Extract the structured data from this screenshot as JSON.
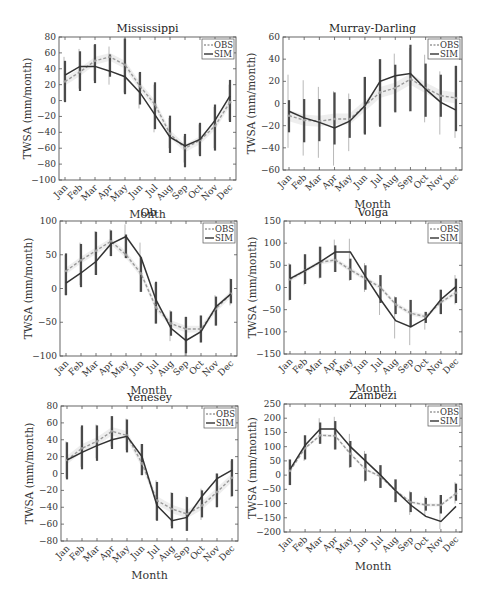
{
  "figure": {
    "months": [
      "Jan",
      "Feb",
      "Mar",
      "Apr",
      "May",
      "Jun",
      "Jul",
      "Aug",
      "Sep",
      "Oct",
      "Nov",
      "Dec"
    ],
    "xlabel": "Month",
    "ylabel": "TWSA (mm/month)",
    "legend": {
      "obs": "OBS",
      "sim": "SIM"
    },
    "colors": {
      "sim": "#333333",
      "obs": "#9a9a9a",
      "obs_band": "#e3e3e3",
      "err_sim": "#4a4a4a",
      "err_obs": "#b8b8b8",
      "axis": "#555555"
    }
  },
  "chart_data": [
    {
      "type": "line",
      "title": "Mississippi",
      "categories": [
        "Jan",
        "Feb",
        "Mar",
        "Apr",
        "May",
        "Jun",
        "Jul",
        "Aug",
        "Sep",
        "Oct",
        "Nov",
        "Dec"
      ],
      "xlabel": "Month",
      "ylabel": "TWSA (mm/month)",
      "ylim": [
        -100,
        80
      ],
      "yticks": [
        80,
        60,
        40,
        20,
        0,
        -20,
        -40,
        -60,
        -80,
        -100
      ],
      "legend_position": "upper right",
      "series": [
        {
          "name": "OBS",
          "style": "dashed",
          "values": [
            24,
            36,
            50,
            55,
            45,
            18,
            -5,
            -42,
            -60,
            -50,
            -32,
            -2
          ],
          "err_low": [
            0,
            15,
            25,
            20,
            10,
            -10,
            -40,
            -60,
            -78,
            -68,
            -60,
            -25
          ],
          "err_high": [
            55,
            65,
            70,
            68,
            78,
            35,
            20,
            -22,
            -45,
            -30,
            -8,
            20
          ]
        },
        {
          "name": "SIM",
          "style": "solid",
          "values": [
            32,
            43,
            43,
            37,
            30,
            10,
            -18,
            -46,
            -57,
            -49,
            -25,
            6
          ],
          "err_low": [
            -2,
            12,
            22,
            30,
            8,
            -5,
            -36,
            -66,
            -84,
            -70,
            -63,
            -27
          ],
          "err_high": [
            50,
            62,
            71,
            58,
            78,
            36,
            23,
            -19,
            -42,
            -28,
            -5,
            26
          ]
        }
      ]
    },
    {
      "type": "line",
      "title": "Murray-Darling",
      "categories": [
        "Jan",
        "Feb",
        "Mar",
        "Apr",
        "May",
        "Jun",
        "Jul",
        "Aug",
        "Sep",
        "Oct",
        "Nov",
        "Dec"
      ],
      "xlabel": "Month",
      "ylabel": "TWSA (mm/month)",
      "ylim": [
        -60,
        60
      ],
      "yticks": [
        60,
        40,
        20,
        0,
        -20,
        -40,
        -60
      ],
      "legend_position": "upper right",
      "series": [
        {
          "name": "OBS",
          "style": "dashed",
          "values": [
            -11,
            -15,
            -16,
            -14,
            -14,
            -2,
            10,
            14,
            22,
            14,
            7,
            5
          ],
          "err_low": [
            -40,
            -47,
            -49,
            -56,
            -43,
            -27,
            -20,
            -7,
            -7,
            -17,
            -28,
            -31
          ],
          "err_high": [
            26,
            21,
            15,
            11,
            9,
            24,
            40,
            45,
            50,
            44,
            29,
            34
          ]
        },
        {
          "name": "SIM",
          "style": "solid",
          "values": [
            -7,
            -13,
            -17,
            -22,
            -16,
            -2,
            20,
            25,
            27,
            13,
            1,
            -6
          ],
          "err_low": [
            -26,
            -35,
            -34,
            -37,
            -31,
            -28,
            -21,
            -8,
            -7,
            -12,
            -12,
            -25
          ],
          "err_high": [
            3,
            4,
            4,
            10,
            4,
            24,
            40,
            35,
            53,
            36,
            26,
            34
          ]
        }
      ]
    },
    {
      "type": "line",
      "title": "Ob",
      "categories": [
        "Jan",
        "Feb",
        "Mar",
        "Apr",
        "May",
        "Jun",
        "Jul",
        "Aug",
        "Sep",
        "Oct",
        "Nov",
        "Dec"
      ],
      "xlabel": "Month",
      "ylabel": "TWSA (mm/month)",
      "ylim": [
        -100,
        100
      ],
      "yticks": [
        100,
        50,
        0,
        -50,
        -100
      ],
      "legend_position": "upper right",
      "series": [
        {
          "name": "OBS",
          "style": "dashed",
          "values": [
            26,
            42,
            56,
            70,
            50,
            22,
            -28,
            -52,
            -60,
            -60,
            -30,
            -8
          ],
          "err_low": [
            -10,
            5,
            20,
            48,
            45,
            -5,
            -52,
            -78,
            -100,
            -80,
            -55,
            -25
          ],
          "err_high": [
            50,
            68,
            85,
            88,
            95,
            68,
            8,
            -32,
            -42,
            -40,
            -10,
            15
          ]
        },
        {
          "name": "SIM",
          "style": "solid",
          "values": [
            8,
            23,
            40,
            66,
            77,
            46,
            -17,
            -59,
            -77,
            -64,
            -27,
            -8
          ],
          "err_low": [
            -10,
            2,
            20,
            48,
            45,
            -5,
            -52,
            -70,
            -96,
            -80,
            -55,
            -22
          ],
          "err_high": [
            52,
            66,
            84,
            86,
            80,
            46,
            10,
            -34,
            -42,
            -40,
            -12,
            14
          ]
        }
      ]
    },
    {
      "type": "line",
      "title": "Volga",
      "categories": [
        "Jan",
        "Feb",
        "Mar",
        "Apr",
        "May",
        "Jun",
        "Jul",
        "Aug",
        "Sep",
        "Oct",
        "Nov",
        "Dec"
      ],
      "xlabel": "Month",
      "ylabel": "TWSA (mm/month)",
      "ylim": [
        -150,
        150
      ],
      "yticks": [
        150,
        100,
        50,
        0,
        -50,
        -100,
        -150
      ],
      "legend_position": "upper right",
      "series": [
        {
          "name": "OBS",
          "style": "dashed",
          "values": [
            18,
            38,
            57,
            62,
            40,
            20,
            0,
            -38,
            -58,
            -66,
            -33,
            -12
          ],
          "err_low": [
            -30,
            5,
            20,
            35,
            15,
            -10,
            -62,
            -115,
            -130,
            -95,
            -60,
            -38
          ],
          "err_high": [
            55,
            75,
            92,
            108,
            110,
            55,
            28,
            -20,
            -28,
            -55,
            -5,
            28
          ]
        },
        {
          "name": "SIM",
          "style": "solid",
          "values": [
            20,
            38,
            58,
            80,
            80,
            25,
            -27,
            -75,
            -89,
            -70,
            -27,
            2
          ],
          "err_low": [
            -28,
            8,
            22,
            35,
            17,
            -5,
            -35,
            -60,
            -88,
            -80,
            -60,
            -35
          ],
          "err_high": [
            52,
            75,
            92,
            95,
            65,
            50,
            28,
            -22,
            -28,
            -55,
            -5,
            20
          ]
        }
      ]
    },
    {
      "type": "line",
      "title": "Yenesey",
      "categories": [
        "Jan",
        "Feb",
        "Mar",
        "Apr",
        "May",
        "Jun",
        "Jul",
        "Aug",
        "Sep",
        "Oct",
        "Nov",
        "Dec"
      ],
      "xlabel": "Month",
      "ylabel": "TWSA (mm/month)",
      "ylim": [
        -80,
        80
      ],
      "yticks": [
        80,
        60,
        40,
        20,
        0,
        -20,
        -40,
        -60,
        -80
      ],
      "legend_position": "upper right",
      "series": [
        {
          "name": "OBS",
          "style": "dashed",
          "values": [
            16,
            30,
            38,
            50,
            45,
            12,
            -32,
            -42,
            -48,
            -38,
            -22,
            -5
          ],
          "err_low": [
            -5,
            8,
            18,
            32,
            28,
            -2,
            -55,
            -62,
            -68,
            -55,
            -40,
            -28
          ],
          "err_high": [
            38,
            55,
            58,
            68,
            65,
            35,
            -8,
            -22,
            -27,
            -18,
            0,
            15
          ]
        },
        {
          "name": "SIM",
          "style": "solid",
          "values": [
            16,
            25,
            33,
            40,
            44,
            20,
            -38,
            -56,
            -52,
            -27,
            -6,
            4
          ],
          "err_low": [
            -7,
            5,
            15,
            29,
            25,
            -2,
            -56,
            -65,
            -68,
            -52,
            -40,
            -27
          ],
          "err_high": [
            37,
            57,
            57,
            68,
            64,
            35,
            -10,
            -23,
            -28,
            -20,
            0,
            17
          ]
        }
      ]
    },
    {
      "type": "line",
      "title": "Zambezi",
      "categories": [
        "Jan",
        "Feb",
        "Mar",
        "Apr",
        "May",
        "Jun",
        "Jul",
        "Aug",
        "Sep",
        "Oct",
        "Nov",
        "Dec"
      ],
      "xlabel": "Month",
      "ylabel": "TWSA (mm/month)",
      "ylim": [
        -200,
        250
      ],
      "yticks": [
        250,
        200,
        150,
        100,
        50,
        0,
        -50,
        -100,
        -150,
        -200
      ],
      "legend_position": "upper right",
      "series": [
        {
          "name": "OBS",
          "style": "dashed",
          "values": [
            15,
            95,
            140,
            138,
            75,
            20,
            -5,
            -55,
            -95,
            -105,
            -105,
            -65
          ],
          "err_low": [
            -35,
            50,
            110,
            90,
            25,
            -25,
            -45,
            -95,
            -140,
            -145,
            -190,
            -100
          ],
          "err_high": [
            55,
            140,
            200,
            205,
            145,
            85,
            35,
            -15,
            -55,
            -75,
            -70,
            -25
          ]
        },
        {
          "name": "SIM",
          "style": "solid",
          "values": [
            20,
            105,
            162,
            162,
            100,
            50,
            0,
            -55,
            -105,
            -145,
            -163,
            -110
          ],
          "err_low": [
            -35,
            55,
            110,
            90,
            28,
            -20,
            -45,
            -95,
            -130,
            -125,
            -135,
            -90
          ],
          "err_high": [
            55,
            140,
            185,
            190,
            120,
            75,
            35,
            -15,
            -60,
            -80,
            -70,
            -30
          ]
        }
      ]
    }
  ],
  "layout": {
    "panels": [
      {
        "left": 59,
        "right": 236,
        "top": 37,
        "bottom": 180
      },
      {
        "left": 283,
        "right": 462,
        "top": 37,
        "bottom": 170
      },
      {
        "left": 60,
        "right": 237,
        "top": 221,
        "bottom": 356
      },
      {
        "left": 284,
        "right": 462,
        "top": 221,
        "bottom": 354
      },
      {
        "left": 61,
        "right": 238,
        "top": 406,
        "bottom": 541
      },
      {
        "left": 284,
        "right": 462,
        "top": 404,
        "bottom": 532
      }
    ]
  }
}
